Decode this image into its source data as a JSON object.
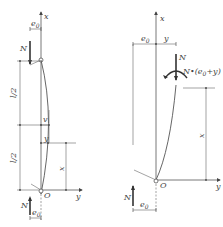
{
  "figure": {
    "left_panel": {
      "labels": {
        "x_axis": "x",
        "y_axis": "y",
        "origin": "O",
        "force_top": "N",
        "force_bottom": "N",
        "eccentricity_top": "e",
        "eccentricity_top_sub": "0",
        "eccentricity_bottom": "e",
        "eccentricity_bottom_sub": "0",
        "half_length_upper": "l/2",
        "half_length_lower": "l/2",
        "deflection_mid": "v",
        "deflection_y": "y",
        "height_x": "x"
      }
    },
    "right_panel": {
      "labels": {
        "x_axis": "x",
        "y_axis": "y",
        "origin": "O",
        "force_top": "N",
        "moment": "N•(e0+y)",
        "moment_prefix": "N•(e",
        "moment_sub": "0",
        "moment_suffix": "+y)",
        "force_bottom": "N",
        "eccentricity_top": "e",
        "eccentricity_top_sub": "0",
        "deflection_top": "y",
        "eccentricity_bottom": "e",
        "eccentricity_bottom_sub": "0",
        "height_x": "x"
      }
    }
  }
}
